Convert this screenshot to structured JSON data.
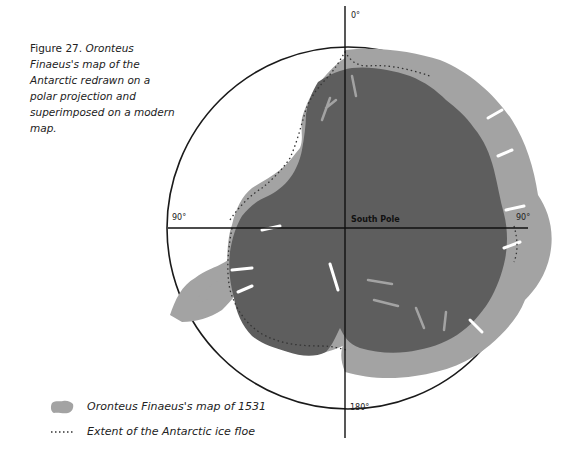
{
  "caption": {
    "figure_label": "Figure 27.",
    "text": "Oronteus Finaeus's map of the Antarctic redrawn on a polar projection and superimposed on a modern map."
  },
  "map": {
    "labels": {
      "top": "0°",
      "left": "90°",
      "right": "90°",
      "bottom": "180°",
      "center": "South Pole"
    },
    "colors": {
      "modern_land": "#5e5e5e",
      "finaeus_map": "#a3a3a3",
      "circle": "#1a1a1a",
      "axis": "#111111",
      "ice_floe_dots": "#333333"
    }
  },
  "legend": {
    "items": [
      {
        "label": "Oronteus Finaeus's map of 1531",
        "symbol": "grey-swatch"
      },
      {
        "label": "Extent of the Antarctic ice floe",
        "symbol": "dotted-line"
      }
    ]
  }
}
